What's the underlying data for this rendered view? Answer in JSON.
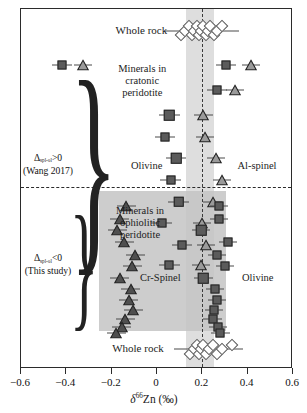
{
  "figure": {
    "panel_upper_label_line1": "Δ",
    "panel_upper_label_sub": "spl-ol",
    "panel_upper_label_line1_tail": ">0",
    "panel_upper_label_line2": "(Wang 2017)",
    "panel_lower_label_line1": "Δ",
    "panel_lower_label_sub": "spl-ol",
    "panel_lower_label_line1_tail": "<0",
    "panel_lower_label_line2": "(This study)",
    "ann_whole_rock_top": "Whole rock",
    "ann_whole_rock_bottom": "Whole rock",
    "ann_cratonic": "Minerals in\ncratonic\nperidotite",
    "ann_cratonic_l1": "Minerals in",
    "ann_cratonic_l2": "cratonic",
    "ann_cratonic_l3": "peridotite",
    "ann_ophiolitic_l1": "Minerals in",
    "ann_ophiolitic_l2": "ophiolitic",
    "ann_ophiolitic_l3": "peridotite",
    "ann_olivine_upper": "Olivine",
    "ann_alspinel": "Al-spinel",
    "ann_crspinel": "Cr-Spinel",
    "ann_olivine_lower": "Olivine",
    "colors": {
      "olivine_square": "#5b5b5b",
      "alspinel_triangle": "#9a9a9a",
      "crspinel_triangle": "#4f4f4f",
      "whole_rock_diamond": "#ffffff",
      "band": "#c9c9c9",
      "greybox": "#c4c4c4",
      "frame": "#2b2b2b"
    }
  },
  "chart_data": {
    "type": "scatter",
    "title": "",
    "xlabel": "δ⁶⁶Zn (‰)",
    "ylabel": "",
    "xlim": [
      -0.6,
      0.6
    ],
    "xticks": [
      -0.6,
      -0.4,
      -0.2,
      0,
      0.2,
      0.4,
      0.6
    ],
    "xticklabels": [
      "-0.6",
      "-0.4",
      "-0.2",
      "0",
      "0.2",
      "0.4",
      "0.6"
    ],
    "grid": false,
    "legend": "in-plot annotations",
    "mantle_reference_line": 0.2,
    "mantle_band": [
      0.13,
      0.25
    ],
    "ophiolite_grey_box": [
      -0.255,
      0.305
    ],
    "panels": [
      {
        "name": "Cratonic peridotite (Wang 2017), Δspl-ol>0",
        "series": [
          {
            "name": "Whole rock",
            "marker": "open-diamond",
            "values": [
              0.105,
              0.125,
              0.14,
              0.155,
              0.165,
              0.175,
              0.185,
              0.195,
              0.205,
              0.215,
              0.225,
              0.235,
              0.25,
              0.265,
              0.285
            ],
            "errors": [
              0.055,
              0.05,
              0.05,
              0.05,
              0.05,
              0.05,
              0.05,
              0.05,
              0.05,
              0.05,
              0.05,
              0.05,
              0.05,
              0.05,
              0.05
            ],
            "row_y": 0.94
          },
          {
            "name": "Olivine",
            "marker": "filled-square",
            "values": [
              -0.42,
              0.305,
              0.265,
              0.055,
              0.035,
              0.085,
              0.06,
              0.095,
              0.02,
              0.11,
              0.055
            ],
            "errors": [
              0.045,
              0.045,
              0.045,
              0.045,
              0.045,
              0.045,
              0.045,
              0.045,
              0.045,
              0.045,
              0.045
            ]
          },
          {
            "name": "Al-spinel",
            "marker": "filled-triangle",
            "values": [
              -0.325,
              0.415,
              0.345,
              0.205,
              0.21,
              0.26,
              0.285,
              0.245,
              0.2,
              0.215,
              0.195
            ],
            "errors": [
              0.04,
              0.04,
              0.04,
              0.04,
              0.04,
              0.04,
              0.04,
              0.04,
              0.04,
              0.04,
              0.04
            ]
          }
        ],
        "pairs_y": [
          0.845,
          0.845,
          0.775,
          0.705,
          0.645,
          0.585,
          0.525,
          0.465,
          0.405,
          0.345,
          0.29
        ]
      },
      {
        "name": "Ophiolitic peridotite (This study), Δspl-ol<0",
        "series": [
          {
            "name": "Cr-Spinel",
            "marker": "filled-triangle-dark",
            "values": [
              -0.135,
              -0.165,
              -0.175,
              -0.145,
              -0.095,
              -0.11,
              -0.165,
              -0.115,
              -0.125,
              -0.105,
              -0.14,
              -0.155,
              -0.18
            ],
            "errors": [
              0.042,
              0.042,
              0.042,
              0.042,
              0.042,
              0.042,
              0.042,
              0.042,
              0.042,
              0.042,
              0.042,
              0.042,
              0.042
            ]
          },
          {
            "name": "Olivine",
            "marker": "filled-square",
            "values": [
              0.275,
              0.275,
              0.195,
              0.315,
              0.265,
              0.3,
              0.205,
              0.255,
              0.265,
              0.25,
              0.245,
              0.27,
              0.28
            ],
            "errors": [
              0.04,
              0.04,
              0.04,
              0.04,
              0.04,
              0.04,
              0.04,
              0.04,
              0.04,
              0.04,
              0.04,
              0.04,
              0.04
            ]
          },
          {
            "name": "Whole rock",
            "marker": "open-diamond",
            "values": [
              0.145,
              0.165,
              0.175,
              0.185,
              0.195,
              0.205,
              0.215,
              0.23,
              0.245,
              0.265,
              0.285,
              0.33
            ],
            "errors": [
              0.05,
              0.05,
              0.05,
              0.05,
              0.05,
              0.05,
              0.05,
              0.05,
              0.05,
              0.05,
              0.05,
              0.05
            ],
            "row_y": 0.055
          }
        ]
      }
    ]
  }
}
